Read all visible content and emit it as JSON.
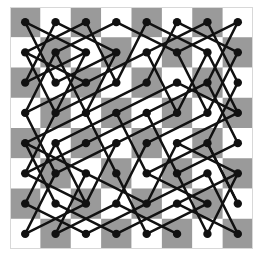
{
  "chart_data": {
    "type": "diagram",
    "title": "",
    "board": {
      "rows": 8,
      "cols": 8,
      "top_left_color": "dark",
      "dark_color": "#9a9a9a",
      "light_color": "#ffffff"
    },
    "style": {
      "line_color": "#111111",
      "dot_color": "#111111",
      "line_width": 2.4,
      "dot_radius": 4.2
    },
    "edges": [
      [
        [
          0,
          0
        ],
        [
          2,
          1
        ]
      ],
      [
        [
          0,
          0
        ],
        [
          1,
          2
        ]
      ],
      [
        [
          1,
          0
        ],
        [
          0,
          2
        ]
      ],
      [
        [
          1,
          0
        ],
        [
          3,
          1
        ]
      ],
      [
        [
          2,
          0
        ],
        [
          0,
          1
        ]
      ],
      [
        [
          2,
          0
        ],
        [
          3,
          2
        ]
      ],
      [
        [
          3,
          0
        ],
        [
          1,
          1
        ]
      ],
      [
        [
          3,
          0
        ],
        [
          5,
          1
        ]
      ],
      [
        [
          4,
          0
        ],
        [
          3,
          2
        ]
      ],
      [
        [
          4,
          0
        ],
        [
          6,
          1
        ]
      ],
      [
        [
          5,
          0
        ],
        [
          4,
          2
        ]
      ],
      [
        [
          5,
          0
        ],
        [
          7,
          1
        ]
      ],
      [
        [
          6,
          0
        ],
        [
          4,
          1
        ]
      ],
      [
        [
          6,
          0
        ],
        [
          7,
          2
        ]
      ],
      [
        [
          7,
          0
        ],
        [
          5,
          1
        ]
      ],
      [
        [
          7,
          0
        ],
        [
          6,
          2
        ]
      ],
      [
        [
          0,
          1
        ],
        [
          2,
          2
        ]
      ],
      [
        [
          0,
          1
        ],
        [
          1,
          3
        ]
      ],
      [
        [
          1,
          1
        ],
        [
          0,
          3
        ]
      ],
      [
        [
          1,
          1
        ],
        [
          2,
          3
        ]
      ],
      [
        [
          2,
          1
        ],
        [
          0,
          2
        ]
      ],
      [
        [
          2,
          1
        ],
        [
          1,
          3
        ]
      ],
      [
        [
          3,
          1
        ],
        [
          1,
          2
        ]
      ],
      [
        [
          3,
          1
        ],
        [
          2,
          3
        ]
      ],
      [
        [
          4,
          1
        ],
        [
          2,
          2
        ]
      ],
      [
        [
          4,
          1
        ],
        [
          5,
          3
        ]
      ],
      [
        [
          5,
          1
        ],
        [
          6,
          3
        ]
      ],
      [
        [
          6,
          1
        ],
        [
          7,
          3
        ]
      ],
      [
        [
          6,
          1
        ],
        [
          5,
          3
        ]
      ],
      [
        [
          7,
          1
        ],
        [
          6,
          3
        ]
      ],
      [
        [
          2,
          2
        ],
        [
          0,
          3
        ]
      ],
      [
        [
          3,
          2
        ],
        [
          1,
          3
        ]
      ],
      [
        [
          4,
          2
        ],
        [
          2,
          3
        ]
      ],
      [
        [
          5,
          2
        ],
        [
          3,
          3
        ]
      ],
      [
        [
          5,
          2
        ],
        [
          7,
          3
        ]
      ],
      [
        [
          6,
          2
        ],
        [
          4,
          3
        ]
      ],
      [
        [
          6,
          2
        ],
        [
          7,
          4
        ]
      ],
      [
        [
          7,
          2
        ],
        [
          6,
          4
        ]
      ],
      [
        [
          0,
          3
        ],
        [
          1,
          5
        ]
      ],
      [
        [
          1,
          3
        ],
        [
          0,
          5
        ]
      ],
      [
        [
          2,
          3
        ],
        [
          0,
          4
        ]
      ],
      [
        [
          2,
          3
        ],
        [
          3,
          5
        ]
      ],
      [
        [
          3,
          3
        ],
        [
          1,
          4
        ]
      ],
      [
        [
          3,
          3
        ],
        [
          4,
          5
        ]
      ],
      [
        [
          4,
          3
        ],
        [
          2,
          4
        ]
      ],
      [
        [
          4,
          3
        ],
        [
          5,
          5
        ]
      ],
      [
        [
          5,
          3
        ],
        [
          3,
          4
        ]
      ],
      [
        [
          6,
          3
        ],
        [
          4,
          4
        ]
      ],
      [
        [
          7,
          3
        ],
        [
          5,
          4
        ]
      ],
      [
        [
          0,
          4
        ],
        [
          2,
          5
        ]
      ],
      [
        [
          0,
          4
        ],
        [
          1,
          6
        ]
      ],
      [
        [
          1,
          4
        ],
        [
          2,
          6
        ]
      ],
      [
        [
          2,
          4
        ],
        [
          0,
          5
        ]
      ],
      [
        [
          3,
          4
        ],
        [
          1,
          5
        ]
      ],
      [
        [
          4,
          4
        ],
        [
          3,
          6
        ]
      ],
      [
        [
          5,
          4
        ],
        [
          7,
          5
        ]
      ],
      [
        [
          6,
          4
        ],
        [
          4,
          5
        ]
      ],
      [
        [
          6,
          4
        ],
        [
          7,
          6
        ]
      ],
      [
        [
          7,
          4
        ],
        [
          5,
          5
        ]
      ],
      [
        [
          0,
          5
        ],
        [
          2,
          6
        ]
      ],
      [
        [
          1,
          5
        ],
        [
          0,
          7
        ]
      ],
      [
        [
          2,
          5
        ],
        [
          1,
          7
        ]
      ],
      [
        [
          2,
          5
        ],
        [
          4,
          6
        ]
      ],
      [
        [
          3,
          5
        ],
        [
          4,
          7
        ]
      ],
      [
        [
          4,
          5
        ],
        [
          6,
          6
        ]
      ],
      [
        [
          5,
          5
        ],
        [
          6,
          7
        ]
      ],
      [
        [
          6,
          5
        ],
        [
          7,
          7
        ]
      ],
      [
        [
          6,
          5
        ],
        [
          4,
          6
        ]
      ],
      [
        [
          7,
          5
        ],
        [
          5,
          6
        ]
      ],
      [
        [
          0,
          6
        ],
        [
          1,
          4
        ]
      ],
      [
        [
          0,
          6
        ],
        [
          2,
          7
        ]
      ],
      [
        [
          1,
          6
        ],
        [
          3,
          7
        ]
      ],
      [
        [
          2,
          6
        ],
        [
          3,
          4
        ]
      ],
      [
        [
          3,
          6
        ],
        [
          5,
          7
        ]
      ],
      [
        [
          4,
          6
        ],
        [
          5,
          4
        ]
      ],
      [
        [
          5,
          6
        ],
        [
          7,
          7
        ]
      ],
      [
        [
          6,
          6
        ],
        [
          4,
          7
        ]
      ],
      [
        [
          7,
          6
        ],
        [
          6,
          4
        ]
      ],
      [
        [
          0,
          7
        ],
        [
          2,
          6
        ]
      ],
      [
        [
          1,
          7
        ],
        [
          3,
          6
        ]
      ],
      [
        [
          2,
          7
        ],
        [
          4,
          6
        ]
      ],
      [
        [
          3,
          7
        ],
        [
          5,
          6
        ]
      ],
      [
        [
          6,
          7
        ],
        [
          7,
          5
        ]
      ]
    ]
  }
}
